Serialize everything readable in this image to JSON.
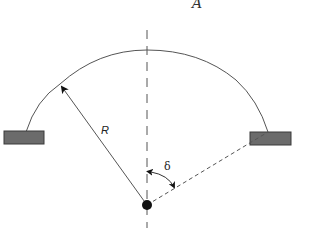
{
  "diagram": {
    "type": "geometry-schematic",
    "labels": {
      "top_label": "A",
      "radius_label": "R",
      "angle_label": "δ"
    },
    "colors": {
      "stroke": "#555555",
      "support_fill": "#6b6b6b",
      "support_stroke": "#3a3a3a",
      "center_dot": "#111111",
      "background": "#ffffff"
    },
    "elements": {
      "center_point": {
        "x": 147,
        "y": 205
      },
      "arc": {
        "start": [
          26,
          132
        ],
        "apex": [
          147,
          50
        ],
        "end": [
          268,
          132
        ]
      },
      "left_support": {
        "x": 4,
        "y": 131,
        "w": 40,
        "h": 13
      },
      "right_support": {
        "x": 250,
        "y": 132,
        "w": 41,
        "h": 13
      },
      "radius_arrow_tip": [
        60,
        84
      ],
      "dashed_ray_end": [
        268,
        132
      ],
      "centerline": {
        "x": 147,
        "y_top": 30,
        "y_bottom": 228
      }
    }
  }
}
